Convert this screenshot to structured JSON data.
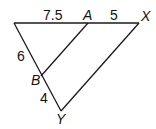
{
  "diagram": {
    "type": "triangle-with-parallel-segment",
    "points": {
      "V": {
        "x": 14,
        "y": 23
      },
      "A": {
        "x": 88,
        "y": 23,
        "label": "A"
      },
      "X": {
        "x": 139,
        "y": 23,
        "label": "X"
      },
      "B": {
        "x": 41,
        "y": 76,
        "label": "B"
      },
      "Y": {
        "x": 61,
        "y": 111,
        "label": "Y"
      }
    },
    "segments": [
      {
        "from": "V",
        "to": "X"
      },
      {
        "from": "V",
        "to": "Y"
      },
      {
        "from": "X",
        "to": "Y"
      },
      {
        "from": "A",
        "to": "B"
      }
    ],
    "labels": {
      "A": "A",
      "X": "X",
      "B": "B",
      "Y": "Y",
      "seg_va": "7.5",
      "seg_ax": "5",
      "seg_vb": "6",
      "seg_by": "4"
    },
    "colors": {
      "line": "#1a1a1a",
      "text": "#111111"
    }
  }
}
